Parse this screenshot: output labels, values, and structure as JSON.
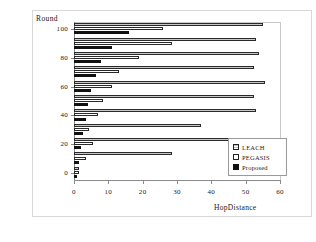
{
  "chart_data": {
    "type": "bar",
    "orientation": "horizontal",
    "title": "",
    "xlabel": "HopDistance",
    "ylabel": "Round",
    "xlim": [
      0,
      60
    ],
    "ylim": [
      0,
      100
    ],
    "xticks": [
      "0",
      "10",
      "20",
      "30",
      "40",
      "50",
      "60"
    ],
    "yticks": [
      "0",
      "20",
      "40",
      "60",
      "80",
      "100"
    ],
    "grid": false,
    "legend_position": "right-inside",
    "categories": [
      0,
      10,
      20,
      30,
      40,
      50,
      60,
      70,
      80,
      90,
      100
    ],
    "series": [
      {
        "name": "LEACH",
        "color": "#c8c8c8",
        "values": [
          1.5,
          28.5,
          48,
          37,
          53,
          52.5,
          55.5,
          52.5,
          54,
          53,
          55
        ]
      },
      {
        "name": "PEGASIS",
        "color": "#ffffff",
        "values": [
          1.5,
          3.5,
          5.5,
          4.5,
          7,
          8.5,
          11,
          13,
          19,
          28.5,
          26
        ]
      },
      {
        "name": "Proposed",
        "color": "#111111",
        "values": [
          1,
          1.5,
          2,
          2.5,
          3.5,
          4,
          5,
          6.5,
          8,
          11,
          16
        ]
      }
    ]
  },
  "legend": {
    "items": [
      {
        "label": "LEACH"
      },
      {
        "label": "PEGASIS"
      },
      {
        "label": "Proposed"
      }
    ]
  }
}
